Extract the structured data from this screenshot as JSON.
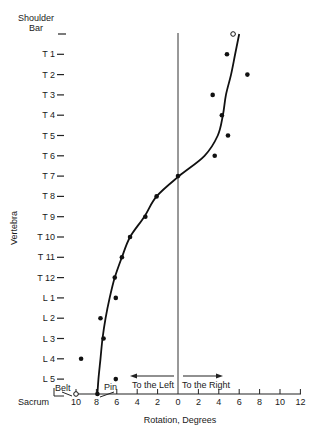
{
  "chart_data": {
    "type": "scatter",
    "title": "",
    "xlabel": "Rotation, Degrees",
    "ylabel": "Vertebra",
    "x_ticks": [
      10,
      8,
      6,
      4,
      2,
      0,
      2,
      4,
      6,
      8,
      10,
      12
    ],
    "x_signed_range": [
      -10,
      12
    ],
    "x_tick_values_signed": [
      -10,
      -8,
      -6,
      -4,
      -2,
      0,
      2,
      4,
      6,
      8,
      10,
      12
    ],
    "direction_labels": {
      "left": "To the Left",
      "right": "To the Right"
    },
    "y_categories": [
      "Shoulder Bar",
      "T 1",
      "T 2",
      "T 3",
      "T 4",
      "T 5",
      "T 6",
      "T 7",
      "T 8",
      "T 9",
      "T 10",
      "T 11",
      "T 12",
      "L 1",
      "L 2",
      "L 3",
      "L 4",
      "L 5",
      "Sacrum"
    ],
    "annotations": [
      "Belt",
      "Pin"
    ],
    "grid": false,
    "series": [
      {
        "name": "Measured rotation",
        "marker": "filled-dot",
        "points": [
          {
            "vertebra": "T 1",
            "x": 4.8
          },
          {
            "vertebra": "T 2",
            "x": 6.8
          },
          {
            "vertebra": "T 3",
            "x": 3.4
          },
          {
            "vertebra": "T 4",
            "x": 4.3
          },
          {
            "vertebra": "T 5",
            "x": 4.9
          },
          {
            "vertebra": "T 6",
            "x": 3.6
          },
          {
            "vertebra": "T 7",
            "x": 0.0
          },
          {
            "vertebra": "T 8",
            "x": -2.1
          },
          {
            "vertebra": "T 9",
            "x": -3.2
          },
          {
            "vertebra": "T 10",
            "x": -4.7
          },
          {
            "vertebra": "T 11",
            "x": -5.5
          },
          {
            "vertebra": "T 12",
            "x": -6.2
          },
          {
            "vertebra": "L 1",
            "x": -6.1
          },
          {
            "vertebra": "L 2",
            "x": -7.6
          },
          {
            "vertebra": "L 3",
            "x": -7.3
          },
          {
            "vertebra": "L 4",
            "x": -9.5
          },
          {
            "vertebra": "L 5",
            "x": -6.1
          },
          {
            "vertebra": "Sacrum",
            "x": -7.9
          }
        ]
      },
      {
        "name": "Fixed references",
        "marker": "open-circle",
        "points": [
          {
            "vertebra": "Shoulder Bar",
            "x": 5.4,
            "label": ""
          },
          {
            "vertebra": "Sacrum",
            "x": -10.0,
            "label": "Belt"
          }
        ]
      },
      {
        "name": "Fitted curve",
        "type": "line",
        "points": [
          {
            "vertebra": "Shoulder Bar",
            "x": 6.0
          },
          {
            "vertebra": "T 1",
            "x": 5.6
          },
          {
            "vertebra": "T 2",
            "x": 5.2
          },
          {
            "vertebra": "T 3",
            "x": 4.7
          },
          {
            "vertebra": "T 4",
            "x": 4.4
          },
          {
            "vertebra": "T 5",
            "x": 3.9
          },
          {
            "vertebra": "T 6",
            "x": 2.6
          },
          {
            "vertebra": "T 7",
            "x": 0.1
          },
          {
            "vertebra": "T 8",
            "x": -2.1
          },
          {
            "vertebra": "T 9",
            "x": -3.3
          },
          {
            "vertebra": "T 10",
            "x": -4.7
          },
          {
            "vertebra": "T 11",
            "x": -5.5
          },
          {
            "vertebra": "T 12",
            "x": -6.2
          },
          {
            "vertebra": "L 1",
            "x": -6.7
          },
          {
            "vertebra": "L 2",
            "x": -7.1
          },
          {
            "vertebra": "L 3",
            "x": -7.4
          },
          {
            "vertebra": "L 4",
            "x": -7.6
          },
          {
            "vertebra": "L 5",
            "x": -7.8
          },
          {
            "vertebra": "Sacrum",
            "x": -7.9
          }
        ]
      }
    ]
  },
  "labels": {
    "y_axis_title": "Vertebra",
    "x_axis_title": "Rotation, Degrees",
    "shoulder_line1": "Shoulder",
    "shoulder_line2": "Bar",
    "sacrum": "Sacrum",
    "belt": "Belt",
    "pin": "Pin",
    "to_left": "To the Left",
    "to_right": "To the Right"
  }
}
